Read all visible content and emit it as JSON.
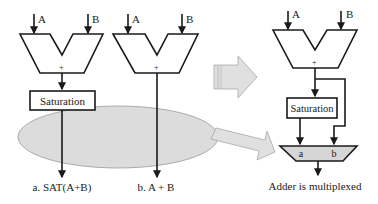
{
  "diagram": {
    "left": {
      "input_a": "A",
      "input_b": "B",
      "adder_symbol": "+",
      "block": "Saturation",
      "caption": "a. SAT(A+B)"
    },
    "middle": {
      "input_a": "A",
      "input_b": "B",
      "adder_symbol": "+",
      "caption": "b. A + B"
    },
    "right": {
      "input_a": "A",
      "input_b": "B",
      "adder_symbol": "+",
      "block": "Saturation",
      "mux_input_a": "a",
      "mux_input_b": "b",
      "caption": "Adder is multiplexed"
    },
    "colors": {
      "stroke": "#1a1a1a",
      "ellipse_fill": "#dcdcdc",
      "arrow_fill": "#e0e0e0",
      "arrow_stroke": "#a8a8a8",
      "mux_fill": "#d6d6d6"
    }
  }
}
